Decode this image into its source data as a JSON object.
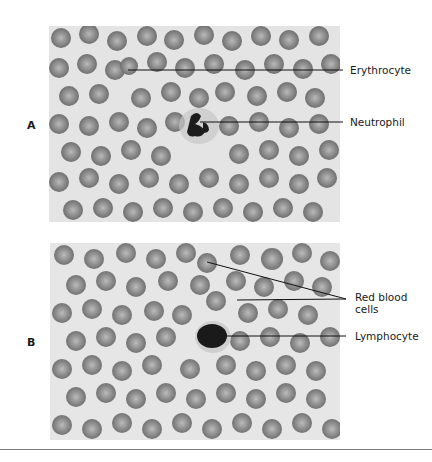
{
  "figure": {
    "panels": [
      {
        "id": "A",
        "label": "A",
        "callouts": [
          {
            "text": "Erythrocyte"
          },
          {
            "text": "Neutrophil"
          }
        ]
      },
      {
        "id": "B",
        "label": "B",
        "callouts": [
          {
            "text_line1": "Red blood",
            "text_line2": "cells"
          },
          {
            "text": "Lymphocyte"
          }
        ]
      }
    ]
  },
  "colors": {
    "background": "#e6e6e6",
    "cell_fill": "#8a8a8a",
    "cell_center": "#b4b4b4",
    "nucleus": "#1e1e1e",
    "leader_line": "#111111"
  }
}
